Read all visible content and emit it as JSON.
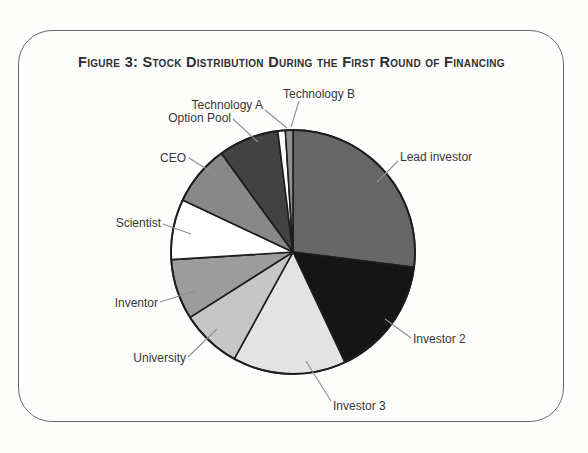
{
  "figure": {
    "title": "Figure 3: Stock Distribution During the First Round of Financing"
  },
  "chart_data": {
    "type": "pie",
    "title": "Figure 3: Stock Distribution During the First Round of Financing",
    "values_unit": "percent",
    "direction": "clockwise",
    "start_angle_deg": 0,
    "center": [
      293,
      252
    ],
    "radius": 122,
    "stroke_color": "#1d1d1d",
    "leader_line_color": "#8f8f8f",
    "slices": [
      {
        "name": "Lead investor",
        "value": 27,
        "color": "#676767",
        "label_pos": {
          "x": 400,
          "y": 150,
          "align": "left"
        },
        "leader": [
          398,
          161,
          377,
          182
        ]
      },
      {
        "name": "Investor 2",
        "value": 16,
        "color": "#151515",
        "label_pos": {
          "x": 413,
          "y": 332,
          "align": "left"
        },
        "leader": [
          411,
          338,
          385,
          319
        ]
      },
      {
        "name": "Investor 3",
        "value": 15,
        "color": "#e3e3e3",
        "label_pos": {
          "x": 333,
          "y": 399,
          "align": "left"
        },
        "leader": [
          331,
          401,
          306,
          361
        ]
      },
      {
        "name": "University",
        "value": 8,
        "color": "#c6c6c6",
        "label_pos": {
          "x": 186,
          "y": 351,
          "align": "right"
        },
        "leader": [
          188,
          357,
          217,
          329
        ]
      },
      {
        "name": "Inventor",
        "value": 8,
        "color": "#9c9c9c",
        "label_pos": {
          "x": 158,
          "y": 296,
          "align": "right"
        },
        "leader": [
          160,
          302,
          195,
          291
        ]
      },
      {
        "name": "Scientist",
        "value": 8,
        "color": "#ffffff",
        "label_pos": {
          "x": 161,
          "y": 216,
          "align": "right"
        },
        "leader": [
          163,
          224,
          191,
          234
        ]
      },
      {
        "name": "CEO",
        "value": 8,
        "color": "#888888",
        "label_pos": {
          "x": 186,
          "y": 151,
          "align": "right"
        },
        "leader": [
          189,
          158,
          218,
          176
        ]
      },
      {
        "name": "Option Pool",
        "value": 8,
        "color": "#424242",
        "label_pos": {
          "x": 231,
          "y": 111,
          "align": "right"
        },
        "leader": [
          233,
          119,
          258,
          142
        ]
      },
      {
        "name": "Technology A",
        "value": 1,
        "color": "#fdfdfd",
        "label_pos": {
          "x": 263,
          "y": 98,
          "align": "right"
        },
        "leader": [
          265,
          110,
          287,
          128
        ]
      },
      {
        "name": "Technology B",
        "value": 1,
        "color": "#919191",
        "label_pos": {
          "x": 283,
          "y": 87,
          "align": "left"
        },
        "leader": [
          299,
          101,
          291,
          127
        ]
      }
    ]
  }
}
